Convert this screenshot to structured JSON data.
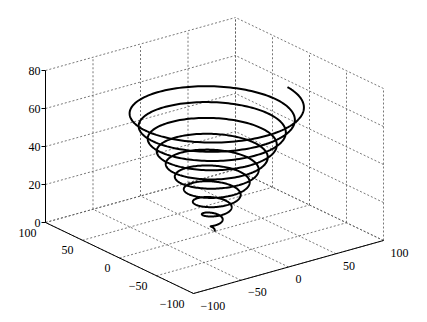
{
  "chart_data": {
    "type": "line3d",
    "title": "",
    "xlabel": "",
    "ylabel": "",
    "zlabel": "",
    "grid": true,
    "xlim": [
      -100,
      100
    ],
    "ylim": [
      -100,
      100
    ],
    "zlim": [
      0,
      80
    ],
    "xticks": [
      -100,
      -50,
      0,
      50,
      100
    ],
    "yticks": [
      -100,
      -50,
      0,
      50,
      100
    ],
    "zticks": [
      0,
      20,
      40,
      60,
      80
    ],
    "xtick_labels": [
      "−100",
      "−50",
      "0",
      "50",
      "100"
    ],
    "ytick_labels": [
      "−100",
      "−50",
      "0",
      "50",
      "100"
    ],
    "ztick_labels": [
      "0",
      "20",
      "40",
      "60",
      "80"
    ],
    "series": [
      {
        "name": "conical spiral",
        "description": "x = t*cos(t), y = t*sin(t), z = t (scaled)",
        "t_start": 0,
        "t_end": 62.8,
        "turns": 10,
        "radius_max": 75,
        "z_max": 66,
        "color": "#000000",
        "line_width": 2
      }
    ]
  },
  "colors": {
    "axis": "#000000",
    "grid": "#555555",
    "line": "#000000",
    "background": "#ffffff"
  }
}
